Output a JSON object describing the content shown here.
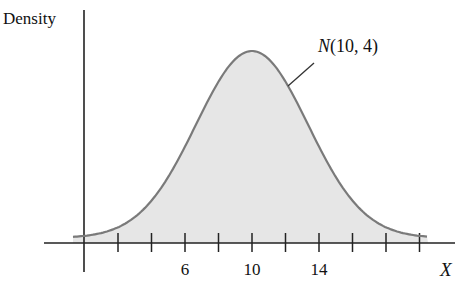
{
  "chart_data": {
    "type": "area",
    "title": "",
    "xlabel": "X",
    "ylabel": "Density",
    "distribution": {
      "name": "Normal",
      "mean": 10,
      "variance": 4,
      "sd": 2
    },
    "annotation": {
      "text": "N(10, 4)",
      "italic_prefix": "N",
      "rest": "(10, 4)",
      "points_to": "curve right shoulder"
    },
    "x_ticks": [
      2,
      4,
      6,
      8,
      10,
      12,
      14,
      16,
      18,
      20
    ],
    "x_tick_labels": [
      {
        "value": 6,
        "label": "6"
      },
      {
        "value": 10,
        "label": "10"
      },
      {
        "value": 14,
        "label": "14"
      }
    ],
    "xlim": [
      -1,
      21
    ],
    "y_ticks": [],
    "grid": false,
    "legend": null,
    "fill": true,
    "colors": {
      "curve": "#7a7a7a",
      "fill": "#e6e6e6",
      "axis": "#222222",
      "text": "#111111"
    },
    "curve_samples": {
      "x": [
        1,
        2,
        4,
        6,
        8,
        10,
        12,
        14,
        16,
        18,
        20
      ],
      "relative_height": [
        0.03,
        0.09,
        0.22,
        0.45,
        0.78,
        1.0,
        0.78,
        0.45,
        0.22,
        0.09,
        0.03
      ]
    }
  }
}
